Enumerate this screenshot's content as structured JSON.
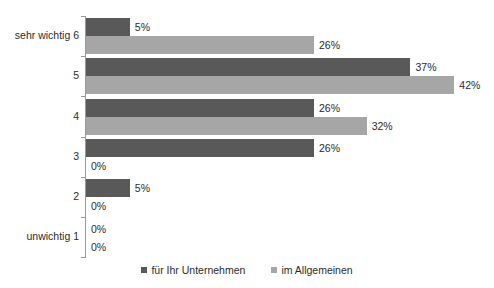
{
  "chart_data": {
    "type": "bar",
    "orientation": "horizontal",
    "title": "",
    "subtitle": "",
    "xlabel": "",
    "ylabel": "",
    "grid": false,
    "legend_position": "bottom-center",
    "xlim": [
      0,
      45
    ],
    "categories": [
      "sehr wichtig 6",
      "5",
      "4",
      "3",
      "2",
      "unwichtig 1"
    ],
    "series": [
      {
        "name": "für Ihr Unternehmen",
        "color": "#595959",
        "values": [
          5,
          37,
          26,
          26,
          5,
          0
        ],
        "labels": [
          "5%",
          "37%",
          "26%",
          "26%",
          "5%",
          "0%"
        ]
      },
      {
        "name": "im Allgemeinen",
        "color": "#a6a6a6",
        "values": [
          26,
          42,
          32,
          0,
          0,
          0
        ],
        "labels": [
          "26%",
          "42%",
          "32%",
          "0%",
          "0%",
          "0%"
        ]
      }
    ],
    "value_suffix": "%",
    "axis_color": "#9a9a9a"
  },
  "legend": {
    "items": [
      {
        "label": "für Ihr Unternehmen",
        "color": "#595959"
      },
      {
        "label": "im Allgemeinen",
        "color": "#a6a6a6"
      }
    ]
  }
}
